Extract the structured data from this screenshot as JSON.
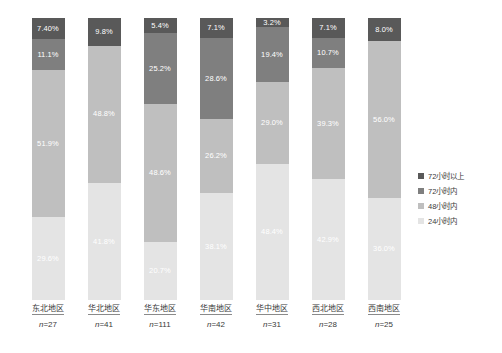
{
  "chart_data": {
    "type": "bar",
    "subtype": "stacked-100-percent",
    "title": "",
    "subtitle": "",
    "xlabel": "",
    "ylabel": "",
    "ylim": [
      0,
      100
    ],
    "grid": false,
    "legend_position": "right",
    "legend": [
      "72小时以上",
      "72小时内",
      "48小时内",
      "24小时内"
    ],
    "series": [
      {
        "name": "72小时以上",
        "color": "#595959",
        "values": [
          7.4,
          9.8,
          5.4,
          7.1,
          3.2,
          7.1,
          8.0
        ]
      },
      {
        "name": "72小时内",
        "color": "#7f7f7f",
        "values": [
          11.1,
          null,
          25.2,
          28.6,
          19.4,
          10.7,
          null
        ]
      },
      {
        "name": "48小时内",
        "color": "#bfbfbf",
        "values": [
          51.9,
          48.8,
          48.6,
          26.2,
          29.0,
          39.3,
          56.0
        ]
      },
      {
        "name": "24小时内",
        "color": "#e4e4e4",
        "values": [
          29.6,
          41.8,
          20.7,
          38.1,
          48.4,
          42.9,
          36.0
        ]
      }
    ],
    "categories": [
      "东北地区",
      "华北地区",
      "华东地区",
      "华南地区",
      "华中地区",
      "西北地区",
      "西南地区"
    ],
    "sample_sizes": [
      "n=27",
      "n=41",
      "n=111",
      "n=42",
      "n=31",
      "n=28",
      "n=25"
    ]
  },
  "legend": {
    "items": [
      {
        "label": "72小时以上",
        "color": "#595959"
      },
      {
        "label": "72小时内",
        "color": "#7f7f7f"
      },
      {
        "label": "48小时内",
        "color": "#bfbfbf"
      },
      {
        "label": "24小时内",
        "color": "#e4e4e4"
      }
    ]
  },
  "bars": [
    {
      "category": "东北地区",
      "n_label": "n=27",
      "n_prefix": "n",
      "n_value": "=27",
      "segments": [
        {
          "class": "s0",
          "label": "7.40%",
          "value": 7.4
        },
        {
          "class": "s1",
          "label": "11.1%",
          "value": 11.1
        },
        {
          "class": "s2",
          "label": "51.9%",
          "value": 51.9
        },
        {
          "class": "s3",
          "label": "29.6%",
          "value": 29.6
        }
      ]
    },
    {
      "category": "华北地区",
      "n_label": "n=41",
      "n_prefix": "n",
      "n_value": "=41",
      "segments": [
        {
          "class": "s0",
          "label": "9.8%",
          "value": 9.8
        },
        {
          "class": "s2",
          "label": "48.8%",
          "value": 48.8
        },
        {
          "class": "s3",
          "label": "41.8%",
          "value": 41.8
        }
      ]
    },
    {
      "category": "华东地区",
      "n_label": "n=111",
      "n_prefix": "n",
      "n_value": "=111",
      "segments": [
        {
          "class": "s0",
          "label": "5.4%",
          "value": 5.4
        },
        {
          "class": "s1",
          "label": "25.2%",
          "value": 25.2
        },
        {
          "class": "s2",
          "label": "48.6%",
          "value": 48.6
        },
        {
          "class": "s3",
          "label": "20.7%",
          "value": 20.7
        }
      ]
    },
    {
      "category": "华南地区",
      "n_label": "n=42",
      "n_prefix": "n",
      "n_value": "=42",
      "segments": [
        {
          "class": "s0",
          "label": "7.1%",
          "value": 7.1
        },
        {
          "class": "s1",
          "label": "28.6%",
          "value": 28.6
        },
        {
          "class": "s2",
          "label": "26.2%",
          "value": 26.2
        },
        {
          "class": "s3",
          "label": "38.1%",
          "value": 38.1
        }
      ]
    },
    {
      "category": "华中地区",
      "n_label": "n=31",
      "n_prefix": "n",
      "n_value": "=31",
      "segments": [
        {
          "class": "s0",
          "label": "3.2%",
          "value": 3.2
        },
        {
          "class": "s1",
          "label": "19.4%",
          "value": 19.4
        },
        {
          "class": "s2",
          "label": "29.0%",
          "value": 29.0
        },
        {
          "class": "s3",
          "label": "48.4%",
          "value": 48.4
        }
      ]
    },
    {
      "category": "西北地区",
      "n_label": "n=28",
      "n_prefix": "n",
      "n_value": "=28",
      "segments": [
        {
          "class": "s0",
          "label": "7.1%",
          "value": 7.1
        },
        {
          "class": "s1",
          "label": "10.7%",
          "value": 10.7
        },
        {
          "class": "s2",
          "label": "39.3%",
          "value": 39.3
        },
        {
          "class": "s3",
          "label": "42.9%",
          "value": 42.9
        }
      ]
    },
    {
      "category": "西南地区",
      "n_label": "n=25",
      "n_prefix": "n",
      "n_value": "=25",
      "segments": [
        {
          "class": "s0",
          "label": "8.0%",
          "value": 8.0
        },
        {
          "class": "s2",
          "label": "56.0%",
          "value": 56.0
        },
        {
          "class": "s3",
          "label": "36.0%",
          "value": 36.0
        }
      ]
    }
  ]
}
